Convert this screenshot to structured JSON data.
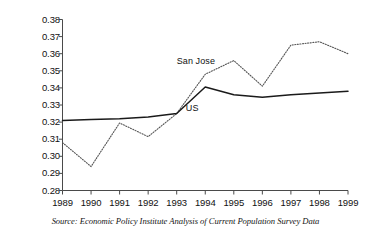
{
  "chart_data": {
    "type": "line",
    "title": "",
    "xlabel": "",
    "ylabel": "Gini co-efficient",
    "x": [
      1989,
      1990,
      1991,
      1992,
      1993,
      1994,
      1995,
      1996,
      1997,
      1998,
      1999
    ],
    "categories": [
      "1989",
      "1990",
      "1991",
      "1992",
      "1993",
      "1994",
      "1995",
      "1996",
      "1997",
      "1998",
      "1999"
    ],
    "ylim": [
      0.28,
      0.38
    ],
    "yticks": [
      0.28,
      0.29,
      0.3,
      0.31,
      0.32,
      0.33,
      0.34,
      0.35,
      0.36,
      0.37,
      0.38
    ],
    "ytick_labels": [
      "0.28",
      "0.29",
      "0.30",
      "0.31",
      "0.32",
      "0.33",
      "0.34",
      "0.35",
      "0.36",
      "0.37",
      "0.38"
    ],
    "grid": false,
    "legend": "inline-labels",
    "series": [
      {
        "name": "San Jose",
        "style": "dotted",
        "color": "#555555",
        "values": [
          0.308,
          0.294,
          0.3195,
          0.3115,
          0.325,
          0.348,
          0.356,
          0.341,
          0.365,
          0.367,
          0.36
        ]
      },
      {
        "name": "US",
        "style": "solid",
        "color": "#1a1a1a",
        "values": [
          0.321,
          0.3215,
          0.322,
          0.323,
          0.325,
          0.3405,
          0.336,
          0.3345,
          0.336,
          0.337,
          0.338
        ]
      }
    ],
    "annotations": [
      {
        "text": "San Jose",
        "x": 1993.0,
        "y": 0.3555
      },
      {
        "text": "US",
        "x": 1993.25,
        "y": 0.3285
      }
    ]
  },
  "axis": {
    "y_title": "Gini co-efficient"
  },
  "labels": {
    "san_jose": "San Jose",
    "us": "US"
  },
  "source": {
    "text": "Source: Economic Policy Institute Analysis of Current Population Survey Data"
  }
}
